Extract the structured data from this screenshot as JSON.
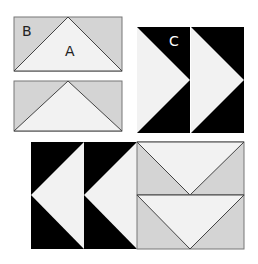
{
  "diagram": {
    "labels": {
      "a": "A",
      "b": "B",
      "c": "C"
    },
    "colors": {
      "light": "#f2f2f2",
      "gray": "#d4d4d4",
      "dark": "#000000",
      "stroke": "#555555"
    },
    "units": [
      {
        "name": "flying-geese-unit-1",
        "pieces": [
          "A center triangle",
          "B corner triangles"
        ]
      },
      {
        "name": "flying-geese-unit-2"
      },
      {
        "name": "flying-geese-pair-c",
        "label": "C"
      },
      {
        "name": "assembled-block"
      }
    ]
  }
}
